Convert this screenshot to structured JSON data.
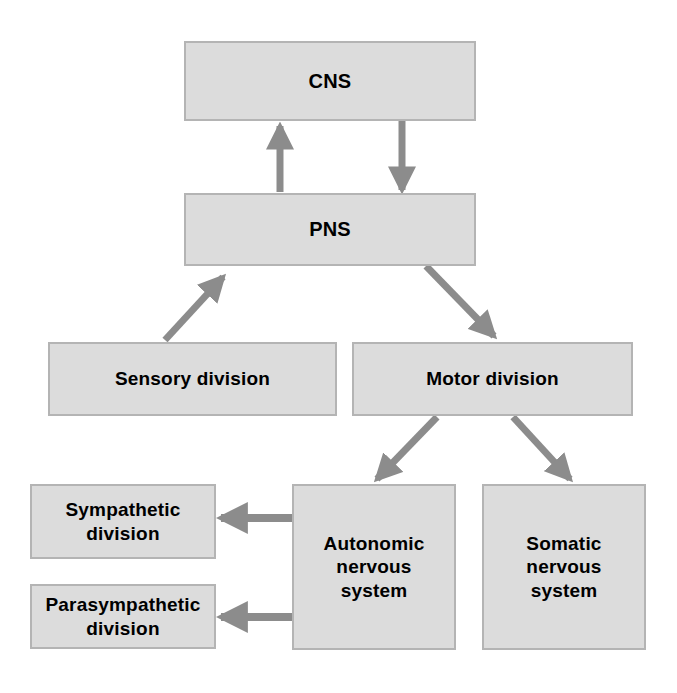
{
  "diagram": {
    "colors": {
      "box_fill": "#dcdcdc",
      "box_border": "#b4b4b4",
      "arrow": "#8c8c8c",
      "text": "#000000",
      "background": "#ffffff"
    },
    "nodes": [
      {
        "id": "cns",
        "label": "CNS"
      },
      {
        "id": "pns",
        "label": "PNS"
      },
      {
        "id": "sensory",
        "label": "Sensory division"
      },
      {
        "id": "motor",
        "label": "Motor  division"
      },
      {
        "id": "symp",
        "label": "Sympathetic\ndivision"
      },
      {
        "id": "parasymp",
        "label": "Parasympathetic\ndivision"
      },
      {
        "id": "ans",
        "label": "Autonomic\nnervous\nsystem"
      },
      {
        "id": "sns",
        "label": "Somatic\nnervous\nsystem"
      }
    ],
    "edges": [
      {
        "id": "pns-to-cns",
        "from": "pns",
        "to": "cns",
        "direction": "up"
      },
      {
        "id": "cns-to-pns",
        "from": "cns",
        "to": "pns",
        "direction": "down"
      },
      {
        "id": "sensory-to-pns",
        "from": "sensory",
        "to": "pns",
        "direction": "up-right"
      },
      {
        "id": "pns-to-motor",
        "from": "pns",
        "to": "motor",
        "direction": "down-right"
      },
      {
        "id": "motor-to-ans",
        "from": "motor",
        "to": "ans",
        "direction": "down-left"
      },
      {
        "id": "motor-to-sns",
        "from": "motor",
        "to": "sns",
        "direction": "down-right"
      },
      {
        "id": "ans-to-symp",
        "from": "ans",
        "to": "symp",
        "direction": "left"
      },
      {
        "id": "ans-to-parasymp",
        "from": "ans",
        "to": "parasymp",
        "direction": "left"
      }
    ]
  }
}
